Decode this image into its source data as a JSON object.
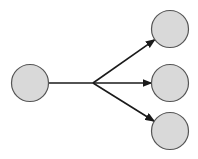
{
  "diagram": {
    "type": "one-to-many fan-out",
    "colors": {
      "background": "#ffffff",
      "node_fill": "#d9d9d9",
      "node_stroke": "#555555",
      "edge": "#1a1a1a"
    },
    "source_node": {
      "id": "source",
      "cx": 30,
      "cy": 83,
      "r": 18.5
    },
    "branch_point": {
      "x": 93,
      "y": 83
    },
    "target_nodes": [
      {
        "id": "target-top",
        "cx": 170,
        "cy": 29,
        "r": 18.5
      },
      {
        "id": "target-middle",
        "cx": 170,
        "cy": 83,
        "r": 18.5
      },
      {
        "id": "target-bottom",
        "cx": 170,
        "cy": 131,
        "r": 18.5
      }
    ],
    "edges": [
      {
        "from": "source",
        "to": "branch"
      },
      {
        "from": "branch",
        "to": "target-top",
        "arrow": true
      },
      {
        "from": "branch",
        "to": "target-middle",
        "arrow": true
      },
      {
        "from": "branch",
        "to": "target-bottom",
        "arrow": true
      }
    ]
  }
}
